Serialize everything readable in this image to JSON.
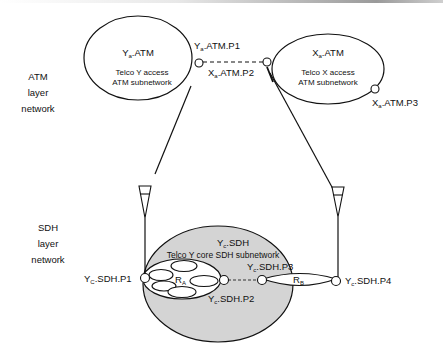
{
  "layers": {
    "atm": {
      "line1": "ATM",
      "line2": "layer",
      "line3": "network"
    },
    "sdh": {
      "line1": "SDH",
      "line2": "layer",
      "line3": "network"
    }
  },
  "atm_subnetworks": {
    "ya": {
      "name_base": "Y",
      "name_sub": "a",
      "name_rest": ".ATM",
      "desc1": "Telco Y access",
      "desc2": "ATM subnetwork"
    },
    "xa": {
      "name_base": "X",
      "name_sub": "a",
      "name_rest": ".ATM",
      "desc1": "Telco X access",
      "desc2": "ATM subnetwork"
    }
  },
  "atm_ports": {
    "p1": {
      "base": "Y",
      "sub": "a",
      "rest": ".ATM.P1"
    },
    "p2": {
      "base": "X",
      "sub": "a",
      "rest": ".ATM.P2"
    },
    "p3": {
      "base": "X",
      "sub": "a",
      "rest": ".ATM.P3"
    }
  },
  "sdh_subnetwork": {
    "name_base": "Y",
    "name_sub": "c",
    "name_rest": ".SDH",
    "desc": "Telco Y core SDH subnetwork"
  },
  "sdh_ports": {
    "p1": {
      "base": "Y",
      "sub": "C",
      "rest": ".SDH.P1"
    },
    "p2": {
      "base": "Y",
      "sub": "c",
      "rest": ".SDH.P2"
    },
    "p3": {
      "base": "Y",
      "sub": "c",
      "rest": ".SDH.P3"
    },
    "p4": {
      "base": "Y",
      "sub": "c",
      "rest": ".SDH.P4"
    }
  },
  "routes": {
    "ra": {
      "base": "R",
      "sub": "A"
    },
    "rb": {
      "base": "R",
      "sub": "B"
    }
  },
  "colors": {
    "core_fill": "#d4d4d4",
    "stroke": "#111111"
  }
}
